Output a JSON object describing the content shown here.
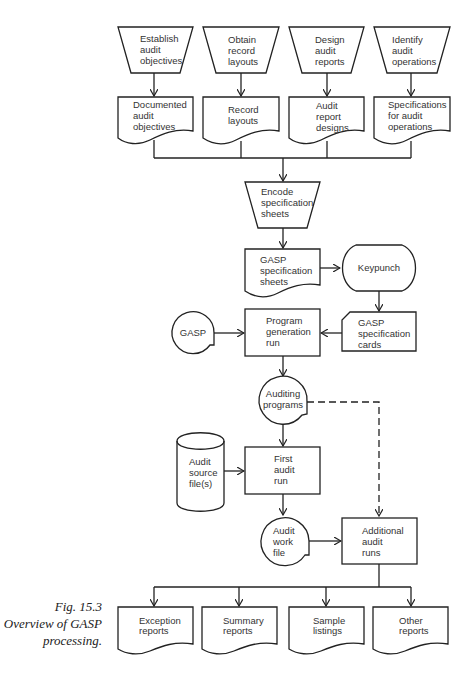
{
  "diagram": {
    "top_inputs": [
      {
        "lines": [
          "Establish",
          "audit",
          "objectives"
        ]
      },
      {
        "lines": [
          "Obtain",
          "record",
          "layouts"
        ]
      },
      {
        "lines": [
          "Design",
          "audit",
          "reports"
        ]
      },
      {
        "lines": [
          "Identify",
          "audit",
          "operations"
        ]
      }
    ],
    "top_documents": [
      {
        "lines": [
          "Documented",
          "audit",
          "objectives"
        ]
      },
      {
        "lines": [
          "Record",
          "layouts"
        ]
      },
      {
        "lines": [
          "Audit",
          "report",
          "designs"
        ]
      },
      {
        "lines": [
          "Specifications",
          "for audit",
          "operations"
        ]
      }
    ],
    "encode": {
      "lines": [
        "Encode",
        "specification",
        "sheets"
      ]
    },
    "spec_sheets": {
      "lines": [
        "GASP",
        "specification",
        "sheets"
      ]
    },
    "keypunch": {
      "lines": [
        "Keypunch"
      ]
    },
    "spec_cards": {
      "lines": [
        "GASP",
        "specification",
        "cards"
      ]
    },
    "gasp_tape": {
      "lines": [
        "GASP"
      ]
    },
    "program_generation": {
      "lines": [
        "Program",
        "generation",
        "run"
      ]
    },
    "auditing_programs": {
      "lines": [
        "Auditing",
        "programs"
      ]
    },
    "audit_source": {
      "lines": [
        "Audit",
        "source",
        "file(s)"
      ]
    },
    "first_audit_run": {
      "lines": [
        "First",
        "audit",
        "run"
      ]
    },
    "audit_work_file": {
      "lines": [
        "Audit",
        "work",
        "file"
      ]
    },
    "additional_runs": {
      "lines": [
        "Additional",
        "audit",
        "runs"
      ]
    },
    "outputs": [
      {
        "lines": [
          "Exception",
          "reports"
        ]
      },
      {
        "lines": [
          "Summary",
          "reports"
        ]
      },
      {
        "lines": [
          "Sample",
          "listings"
        ]
      },
      {
        "lines": [
          "Other",
          "reports"
        ]
      }
    ]
  },
  "caption": {
    "line1": "Fig. 15.3",
    "line2": "Overview of GASP",
    "line3": "processing."
  }
}
